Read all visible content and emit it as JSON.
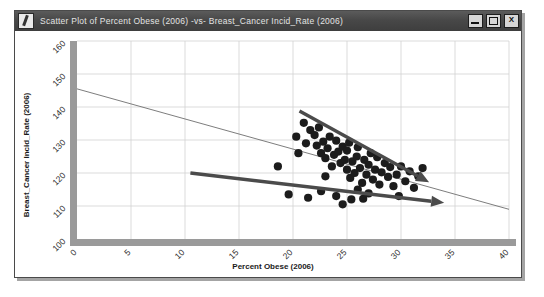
{
  "window": {
    "title": "Scatter Plot of Percent Obese (2006) -vs- Breast_Cancer Incid_Rate (2006)",
    "icon": "pencil-icon",
    "controls": {
      "minimize_label": "",
      "maximize_label": "",
      "close_label": "X"
    }
  },
  "chart_data": {
    "type": "scatter",
    "title": "Scatter Plot of Percent Obese (2006) -vs- Breast_Cancer Incid_Rate (2006)",
    "xlabel": "Percent Obese (2006)",
    "ylabel": "Breast_Cancer Incid_Rate (2006)",
    "xlim": [
      0,
      40
    ],
    "ylim": [
      100,
      160
    ],
    "xticks": [
      0,
      5,
      10,
      15,
      20,
      25,
      30,
      35,
      40
    ],
    "yticks": [
      100,
      110,
      120,
      130,
      140,
      150,
      160
    ],
    "xtick_labels": [
      "0",
      "5",
      "10",
      "15",
      "20",
      "25",
      "30",
      "35",
      "40"
    ],
    "ytick_labels": [
      "100",
      "110",
      "120",
      "130",
      "140",
      "150",
      "160"
    ],
    "grid": true,
    "legend": "none",
    "tick_label_rotation_deg": 45,
    "points": [
      [
        20.3,
        131.0
      ],
      [
        21.0,
        135.2
      ],
      [
        21.2,
        129.0
      ],
      [
        21.6,
        133.0
      ],
      [
        22.0,
        131.5
      ],
      [
        22.2,
        128.3
      ],
      [
        22.4,
        133.8
      ],
      [
        22.6,
        126.0
      ],
      [
        22.8,
        129.5
      ],
      [
        23.0,
        124.5
      ],
      [
        23.2,
        127.5
      ],
      [
        23.4,
        131.0
      ],
      [
        23.6,
        122.0
      ],
      [
        23.8,
        125.5
      ],
      [
        24.0,
        129.8
      ],
      [
        24.2,
        126.5
      ],
      [
        24.4,
        123.0
      ],
      [
        24.6,
        128.0
      ],
      [
        24.8,
        124.0
      ],
      [
        25.0,
        121.0
      ],
      [
        25.0,
        126.8
      ],
      [
        25.2,
        129.2
      ],
      [
        25.3,
        118.5
      ],
      [
        25.5,
        123.5
      ],
      [
        25.7,
        120.0
      ],
      [
        25.9,
        125.0
      ],
      [
        26.0,
        127.8
      ],
      [
        26.2,
        121.5
      ],
      [
        26.4,
        117.0
      ],
      [
        26.6,
        124.0
      ],
      [
        26.8,
        119.5
      ],
      [
        27.0,
        122.5
      ],
      [
        27.2,
        126.0
      ],
      [
        27.4,
        118.0
      ],
      [
        27.6,
        121.0
      ],
      [
        27.8,
        124.8
      ],
      [
        28.0,
        116.5
      ],
      [
        28.2,
        120.2
      ],
      [
        28.5,
        123.0
      ],
      [
        28.8,
        118.8
      ],
      [
        29.0,
        121.8
      ],
      [
        29.3,
        116.0
      ],
      [
        29.6,
        119.5
      ],
      [
        30.0,
        122.0
      ],
      [
        30.4,
        117.5
      ],
      [
        30.8,
        120.5
      ],
      [
        31.2,
        115.5
      ],
      [
        31.6,
        119.0
      ],
      [
        32.0,
        121.5
      ],
      [
        18.6,
        122.0
      ],
      [
        19.6,
        113.5
      ],
      [
        21.4,
        112.5
      ],
      [
        22.6,
        114.5
      ],
      [
        24.0,
        113.0
      ],
      [
        25.4,
        112.0
      ],
      [
        26.0,
        115.0
      ],
      [
        27.0,
        113.8
      ],
      [
        24.6,
        110.5
      ],
      [
        20.5,
        126.0
      ],
      [
        23.0,
        119.0
      ],
      [
        26.5,
        112.2
      ],
      [
        29.8,
        113.0
      ]
    ],
    "fit_line": {
      "name": "regression-line",
      "x1": 0.0,
      "y1": 145.5,
      "x2": 40.0,
      "y2": 109.0
    },
    "annotations": [
      {
        "name": "upper-trend-arrow",
        "type": "arrow",
        "x1": 20.6,
        "y1": 138.8,
        "x2": 32.6,
        "y2": 117.2
      },
      {
        "name": "lower-trend-arrow",
        "type": "arrow",
        "x1": 10.5,
        "y1": 120.0,
        "x2": 34.0,
        "y2": 111.0
      }
    ]
  }
}
